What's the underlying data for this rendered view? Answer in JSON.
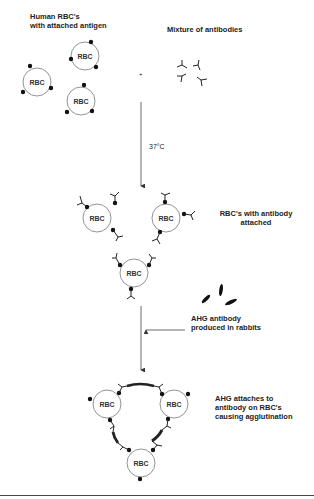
{
  "diagram": {
    "stage1": {
      "rbc_label_line1": "Human RBC's",
      "rbc_label_line2": "with attached antigen",
      "antibody_label": "Mixture of antibodies",
      "plus": "+",
      "cell_label": "RBC"
    },
    "step1": {
      "condition": "37°C"
    },
    "stage2": {
      "label_line1": "RBC's with antibody",
      "label_line2": "attached",
      "cell_label": "RBC"
    },
    "step2": {
      "label_line1": "AHG antibody",
      "label_line2": "produced in rabbits"
    },
    "stage3": {
      "label_line1": "AHG attaches to",
      "label_line2": "antibody on RBC's",
      "label_line3": "causing agglutination",
      "cell_label": "RBC"
    }
  }
}
